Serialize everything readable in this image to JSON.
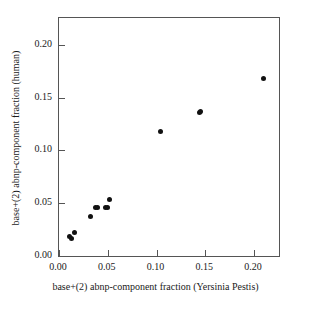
{
  "chart_data": {
    "type": "scatter",
    "title": "",
    "xlabel": "base+(2) abnp-component fraction (Yersinia Pestis)",
    "ylabel": "base+(2) abnp-component fraction (human)",
    "xlim": [
      0.0,
      0.2255
    ],
    "ylim": [
      0.0,
      0.2255
    ],
    "grid": false,
    "legend": null,
    "xticks": [
      0.0,
      0.05,
      0.1,
      0.15,
      0.2
    ],
    "yticks": [
      0.0,
      0.05,
      0.1,
      0.15,
      0.2
    ],
    "xticklabels": [
      "0.00",
      "0.05",
      "0.10",
      "0.15",
      "0.20"
    ],
    "yticklabels": [
      "0.00",
      "0.05",
      "0.10",
      "0.15",
      "0.20"
    ],
    "marker": "filled-circle",
    "marker_color": "#111111",
    "points": [
      {
        "x": 0.0105,
        "y": 0.0185
      },
      {
        "x": 0.0125,
        "y": 0.0165
      },
      {
        "x": 0.0155,
        "y": 0.0225
      },
      {
        "x": 0.0325,
        "y": 0.037
      },
      {
        "x": 0.0375,
        "y": 0.0455
      },
      {
        "x": 0.0395,
        "y": 0.0455
      },
      {
        "x": 0.0475,
        "y": 0.0455
      },
      {
        "x": 0.0495,
        "y": 0.0455
      },
      {
        "x": 0.0515,
        "y": 0.054
      },
      {
        "x": 0.1045,
        "y": 0.1175
      },
      {
        "x": 0.1445,
        "y": 0.1355
      },
      {
        "x": 0.1455,
        "y": 0.1365
      },
      {
        "x": 0.2095,
        "y": 0.1685
      }
    ]
  }
}
